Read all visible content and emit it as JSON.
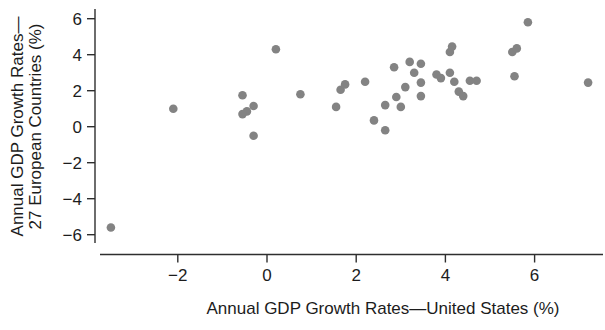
{
  "figure": {
    "background": "#ffffff",
    "axis_color": "#2e2e2e",
    "text_color": "#1c1c1c",
    "point_color": "#838383"
  },
  "chart_data": {
    "type": "scatter",
    "title": "",
    "xlabel": "Annual GDP Growth Rates—United States (%)",
    "ylabel_line1": "Annual GDP Growth Rates—",
    "ylabel_line2": "27 European Countries (%)",
    "xlim": [
      -3.9,
      7.6
    ],
    "ylim": [
      -6.8,
      6.8
    ],
    "x_ticks": [
      -2,
      0,
      2,
      4,
      6
    ],
    "y_ticks": [
      6,
      4,
      2,
      0,
      -2,
      -4,
      -6
    ],
    "grid": false,
    "legend": "none",
    "points": [
      [
        -3.5,
        -5.6
      ],
      [
        -2.1,
        1.0
      ],
      [
        -0.55,
        1.75
      ],
      [
        -0.3,
        1.15
      ],
      [
        -0.45,
        0.85
      ],
      [
        -0.55,
        0.7
      ],
      [
        -0.3,
        -0.5
      ],
      [
        0.2,
        4.3
      ],
      [
        0.75,
        1.8
      ],
      [
        1.55,
        1.1
      ],
      [
        1.65,
        2.05
      ],
      [
        1.75,
        2.35
      ],
      [
        2.2,
        2.5
      ],
      [
        2.4,
        0.35
      ],
      [
        2.65,
        -0.2
      ],
      [
        2.65,
        1.2
      ],
      [
        2.85,
        3.3
      ],
      [
        2.9,
        1.65
      ],
      [
        3.0,
        1.1
      ],
      [
        3.1,
        2.2
      ],
      [
        3.2,
        3.6
      ],
      [
        3.3,
        3.0
      ],
      [
        3.45,
        3.5
      ],
      [
        3.45,
        2.45
      ],
      [
        3.45,
        1.7
      ],
      [
        3.8,
        2.9
      ],
      [
        3.9,
        2.7
      ],
      [
        4.1,
        3.0
      ],
      [
        4.1,
        4.15
      ],
      [
        4.15,
        4.45
      ],
      [
        4.2,
        2.5
      ],
      [
        4.3,
        1.95
      ],
      [
        4.4,
        1.7
      ],
      [
        4.55,
        2.55
      ],
      [
        4.7,
        2.55
      ],
      [
        5.5,
        4.15
      ],
      [
        5.6,
        4.35
      ],
      [
        5.55,
        2.8
      ],
      [
        5.85,
        5.8
      ],
      [
        7.2,
        2.45
      ]
    ]
  },
  "geometry_note": "x axis: value 0 at px 267, 44.6 px per unit; y axis: value 0 at px 126.7, 18 px per unit"
}
